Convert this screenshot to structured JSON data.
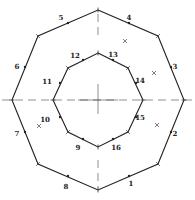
{
  "diagram": {
    "type": "concentric-octagons",
    "center": [
      98,
      100
    ],
    "outer_octagon": {
      "vertices": [
        [
          98,
          10
        ],
        [
          158,
          36
        ],
        [
          184,
          100
        ],
        [
          158,
          164
        ],
        [
          98,
          190
        ],
        [
          38,
          164
        ],
        [
          12,
          100
        ],
        [
          38,
          36
        ]
      ]
    },
    "inner_octagon": {
      "vertices": [
        [
          98,
          53
        ],
        [
          128,
          68
        ],
        [
          143,
          100
        ],
        [
          128,
          132
        ],
        [
          98,
          147
        ],
        [
          68,
          132
        ],
        [
          53,
          100
        ],
        [
          68,
          68
        ]
      ]
    },
    "outer_labels": [
      {
        "text": "1",
        "dot": [
          129,
          176
        ],
        "pos": [
          131,
          186
        ]
      },
      {
        "text": "2",
        "dot": [
          171,
          132
        ],
        "pos": [
          175,
          136
        ]
      },
      {
        "text": "3",
        "dot": [
          171,
          67
        ],
        "pos": [
          175,
          69
        ]
      },
      {
        "text": "4",
        "dot": [
          129,
          23
        ],
        "pos": [
          129,
          20
        ]
      },
      {
        "text": "5",
        "dot": [
          68,
          23
        ],
        "pos": [
          61,
          20
        ]
      },
      {
        "text": "6",
        "dot": [
          25,
          67
        ],
        "pos": [
          17,
          69
        ]
      },
      {
        "text": "7",
        "dot": [
          25,
          132
        ],
        "pos": [
          17,
          136
        ]
      },
      {
        "text": "8",
        "dot": [
          68,
          176
        ],
        "pos": [
          66,
          189
        ]
      }
    ],
    "inner_labels": [
      {
        "text": "9",
        "dot": [
          83,
          139
        ],
        "pos": [
          78,
          150
        ]
      },
      {
        "text": "10",
        "dot": [
          60,
          117
        ],
        "pos": [
          45,
          122
        ]
      },
      {
        "text": "11",
        "dot": [
          60,
          83
        ],
        "pos": [
          47,
          84
        ]
      },
      {
        "text": "12",
        "dot": [
          83,
          60
        ],
        "pos": [
          75,
          58
        ]
      },
      {
        "text": "13",
        "dot": [
          113,
          60
        ],
        "pos": [
          113,
          57
        ]
      },
      {
        "text": "14",
        "dot": [
          136,
          83
        ],
        "pos": [
          140,
          83
        ]
      },
      {
        "text": "15",
        "dot": [
          136,
          117
        ],
        "pos": [
          140,
          120
        ]
      },
      {
        "text": "16",
        "dot": [
          113,
          139
        ],
        "pos": [
          116,
          150
        ]
      }
    ],
    "x_marks": [
      [
        125,
        41
      ],
      [
        154,
        73
      ],
      [
        157,
        125
      ],
      [
        39,
        126
      ]
    ]
  }
}
